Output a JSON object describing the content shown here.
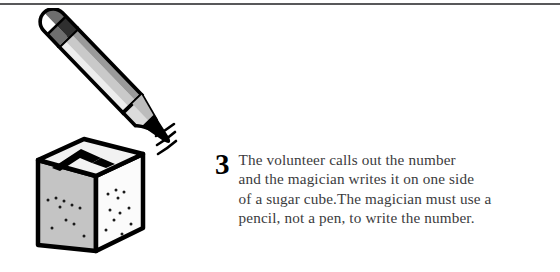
{
  "page": {
    "width": 560,
    "height": 272,
    "background_color": "#ffffff",
    "top_rule_color": "#58585a"
  },
  "step": {
    "number": "3",
    "text_lines": [
      "The volunteer calls out the number",
      "and the magician writes it on one side",
      "of a sugar cube.The magician must use a",
      "pencil, not a pen, to write the number."
    ],
    "full_text": "The volunteer calls out the number and the magician writes it on one side of a sugar cube.The magician must use a pencil, not a pen, to write the number.",
    "number_color": "#000000",
    "text_color": "#3b3b3d"
  },
  "illustration": {
    "name": "pencil-writing-on-sugar-cube",
    "parts": [
      {
        "name": "pencil",
        "label": "pencil"
      },
      {
        "name": "pencil-eraser",
        "label": "checkered eraser end"
      },
      {
        "name": "pencil-tip",
        "label": "sharpened graphite tip"
      },
      {
        "name": "sugar-cube",
        "label": "sugar cube"
      },
      {
        "name": "cube-mark",
        "label": "chevron mark written on top face"
      },
      {
        "name": "motion-lines",
        "label": "motion lines"
      }
    ],
    "colors": {
      "outline": "#000000",
      "pencil_light": "#e8e8e8",
      "pencil_mid": "#c9c9c9",
      "pencil_dark": "#9a9a9a",
      "eraser_white": "#ffffff",
      "eraser_gray": "#6e6e6e",
      "eraser_dark": "#3a3a3a",
      "cube_left_face": "#c4c4c4",
      "cube_right_face": "#fbfbfb",
      "cube_top_face": "#f2f2f2",
      "speckle": "#1a1a1a"
    }
  }
}
